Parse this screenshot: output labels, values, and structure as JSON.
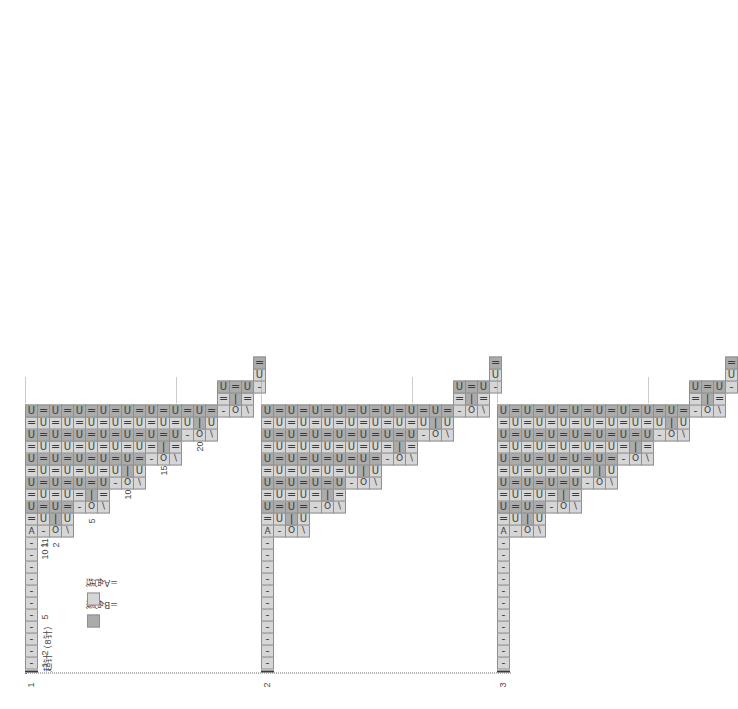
{
  "document": {
    "type": "knitting-chart",
    "orientation": "rotated-90-ccw",
    "cast_on_caption": "起针（8针）"
  },
  "legend": {
    "items": [
      {
        "key": "B",
        "swatch_color": "#ababab",
        "label": "=B色线"
      },
      {
        "key": "A",
        "swatch_color": "#d6d6d6",
        "label": "=A色线"
      }
    ]
  },
  "axis": {
    "block_labels": [
      "1",
      "2",
      "3"
    ],
    "column_numbers": [
      "1",
      "2",
      "5",
      "10",
      "11"
    ],
    "row_numbers": [
      "1",
      "2",
      "5",
      "10",
      "15",
      "20"
    ]
  },
  "symbols": {
    "knit": "=",
    "purl": "U",
    "yarn_over": "O",
    "make_one": "|",
    "dash": "-",
    "ssk": "\\",
    "marker": "A"
  },
  "chart_data": {
    "type": "table",
    "title": "起针（8针）",
    "blocks": 3,
    "rows_per_block": 20,
    "max_columns": 11,
    "repeat_note": "three identical staircase repeats",
    "colors": {
      "A": "#d6d6d6",
      "B": "#ababab",
      "grid": "#8e8e8e",
      "axis": "#3b3b3b"
    }
  }
}
